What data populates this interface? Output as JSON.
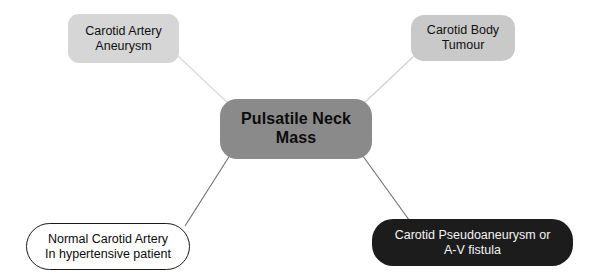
{
  "diagram": {
    "type": "radial-concept-map",
    "background_color": "#ffffff",
    "width": 598,
    "height": 280,
    "center": {
      "id": "pulsatile-neck-mass",
      "label": "Pulsatile Neck\nMass",
      "fill_color": "#8a8a8a",
      "text_color": "#0c0c0c"
    },
    "branches": [
      {
        "id": "carotid-artery-aneurysm",
        "label": "Carotid Artery\nAneurysm",
        "position": "top-left",
        "fill_color": "#d6d6d6",
        "text_color": "#101010",
        "connector_color": "#dcdcdc"
      },
      {
        "id": "carotid-body-tumour",
        "label": "Carotid Body\nTumour",
        "position": "top-right",
        "fill_color": "#c9c9c9",
        "text_color": "#101010",
        "connector_color": "#d2d2d2"
      },
      {
        "id": "normal-carotid-artery",
        "label": "Normal Carotid Artery\nIn hypertensive patient",
        "position": "bottom-left",
        "fill_color": "#ffffff",
        "border_color": "#1a1a1a",
        "text_color": "#0c0c0c",
        "connector_color": "#6e6e6e"
      },
      {
        "id": "carotid-pseudoaneurysm-av-fistula",
        "label": "Carotid Pseudoaneurysm or\nA-V fistula",
        "position": "bottom-right",
        "fill_color": "#1c1c1c",
        "text_color": "#f4f4f4",
        "connector_color": "#6e6e6e"
      }
    ]
  }
}
